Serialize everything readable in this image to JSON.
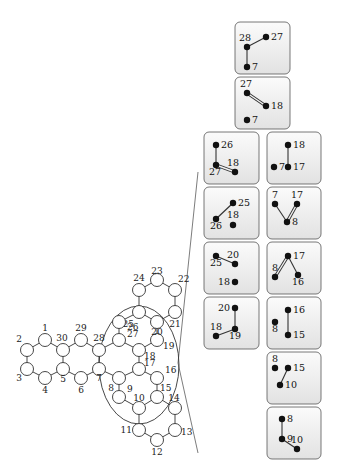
{
  "graph": {
    "nodes": [
      {
        "id": "1",
        "label": "1"
      },
      {
        "id": "2",
        "label": "2"
      },
      {
        "id": "3",
        "label": "3"
      },
      {
        "id": "4",
        "label": "4"
      },
      {
        "id": "5",
        "label": "5"
      },
      {
        "id": "6",
        "label": "6"
      },
      {
        "id": "7",
        "label": "7"
      },
      {
        "id": "8",
        "label": "8"
      },
      {
        "id": "9",
        "label": "9"
      },
      {
        "id": "10",
        "label": "10"
      },
      {
        "id": "11",
        "label": "11"
      },
      {
        "id": "12",
        "label": "12"
      },
      {
        "id": "13",
        "label": "13"
      },
      {
        "id": "14",
        "label": "14"
      },
      {
        "id": "15",
        "label": "15"
      },
      {
        "id": "16",
        "label": "16"
      },
      {
        "id": "17",
        "label": "17"
      },
      {
        "id": "18",
        "label": "18"
      },
      {
        "id": "19",
        "label": "19"
      },
      {
        "id": "20",
        "label": "20"
      },
      {
        "id": "21",
        "label": "21"
      },
      {
        "id": "22",
        "label": "22"
      },
      {
        "id": "23",
        "label": "23"
      },
      {
        "id": "24",
        "label": "24"
      },
      {
        "id": "25",
        "label": "25"
      },
      {
        "id": "26",
        "label": "26"
      },
      {
        "id": "27",
        "label": "27"
      },
      {
        "id": "28",
        "label": "28"
      },
      {
        "id": "29",
        "label": "29"
      },
      {
        "id": "30",
        "label": "30"
      }
    ],
    "edges": [
      [
        "1",
        "2"
      ],
      [
        "2",
        "3"
      ],
      [
        "3",
        "4"
      ],
      [
        "4",
        "5"
      ],
      [
        "5",
        "30"
      ],
      [
        "30",
        "1"
      ],
      [
        "30",
        "29"
      ],
      [
        "29",
        "28"
      ],
      [
        "28",
        "7"
      ],
      [
        "7",
        "6"
      ],
      [
        "6",
        "5"
      ],
      [
        "28",
        "27"
      ],
      [
        "27",
        "18"
      ],
      [
        "18",
        "17"
      ],
      [
        "17",
        "8"
      ],
      [
        "8",
        "7"
      ],
      [
        "27",
        "26"
      ],
      [
        "26",
        "25"
      ],
      [
        "25",
        "20"
      ],
      [
        "20",
        "19"
      ],
      [
        "19",
        "18"
      ],
      [
        "25",
        "24"
      ],
      [
        "24",
        "23"
      ],
      [
        "23",
        "22"
      ],
      [
        "22",
        "21"
      ],
      [
        "21",
        "20"
      ],
      [
        "8",
        "9"
      ],
      [
        "9",
        "10"
      ],
      [
        "10",
        "15"
      ],
      [
        "15",
        "16"
      ],
      [
        "16",
        "17"
      ],
      [
        "10",
        "11"
      ],
      [
        "11",
        "12"
      ],
      [
        "12",
        "13"
      ],
      [
        "13",
        "14"
      ],
      [
        "14",
        "15"
      ]
    ]
  },
  "panels": [
    {
      "id": "p1",
      "nodes": [
        {
          "label": "28"
        },
        {
          "label": "27"
        },
        {
          "label": "7"
        }
      ],
      "edges": [
        [
          "28",
          "27",
          "single"
        ],
        [
          "28",
          "7",
          "single"
        ]
      ]
    },
    {
      "id": "p2",
      "nodes": [
        {
          "label": "27"
        },
        {
          "label": "18"
        },
        {
          "label": "7"
        }
      ],
      "edges": [
        [
          "27",
          "18",
          "double"
        ]
      ]
    },
    {
      "id": "p3",
      "nodes": [
        {
          "label": "26"
        },
        {
          "label": "27"
        },
        {
          "label": "18"
        }
      ],
      "edges": [
        [
          "26",
          "27",
          "single"
        ],
        [
          "27",
          "18",
          "double"
        ]
      ]
    },
    {
      "id": "p4",
      "nodes": [
        {
          "label": "25"
        },
        {
          "label": "26"
        },
        {
          "label": "18"
        }
      ],
      "edges": [
        [
          "25",
          "26",
          "single"
        ]
      ]
    },
    {
      "id": "p5",
      "nodes": [
        {
          "label": "25"
        },
        {
          "label": "20"
        },
        {
          "label": "18"
        }
      ],
      "edges": [
        [
          "25",
          "20",
          "single"
        ]
      ]
    },
    {
      "id": "p6",
      "nodes": [
        {
          "label": "20"
        },
        {
          "label": "18"
        },
        {
          "label": "19"
        }
      ],
      "edges": [
        [
          "20",
          "19",
          "single"
        ],
        [
          "18",
          "19",
          "single"
        ]
      ]
    },
    {
      "id": "p7",
      "nodes": [
        {
          "label": "18"
        },
        {
          "label": "7"
        },
        {
          "label": "17"
        }
      ],
      "edges": [
        [
          "18",
          "17",
          "single"
        ]
      ]
    },
    {
      "id": "p8",
      "nodes": [
        {
          "label": "7"
        },
        {
          "label": "17"
        },
        {
          "label": "8"
        }
      ],
      "edges": [
        [
          "7",
          "8",
          "single"
        ],
        [
          "17",
          "8",
          "double"
        ]
      ]
    },
    {
      "id": "p9",
      "nodes": [
        {
          "label": "17"
        },
        {
          "label": "8"
        },
        {
          "label": "16"
        }
      ],
      "edges": [
        [
          "17",
          "8",
          "double"
        ],
        [
          "17",
          "16",
          "single"
        ]
      ]
    },
    {
      "id": "p10",
      "nodes": [
        {
          "label": "16"
        },
        {
          "label": "8"
        },
        {
          "label": "15"
        }
      ],
      "edges": [
        [
          "16",
          "15",
          "single"
        ]
      ]
    },
    {
      "id": "p11",
      "nodes": [
        {
          "label": "8"
        },
        {
          "label": "15"
        },
        {
          "label": "10"
        }
      ],
      "edges": [
        [
          "15",
          "10",
          "single"
        ]
      ]
    },
    {
      "id": "p12",
      "nodes": [
        {
          "label": "8"
        },
        {
          "label": "9"
        },
        {
          "label": "10"
        }
      ],
      "edges": [
        [
          "8",
          "9",
          "single"
        ],
        [
          "9",
          "10",
          "single"
        ]
      ]
    }
  ]
}
